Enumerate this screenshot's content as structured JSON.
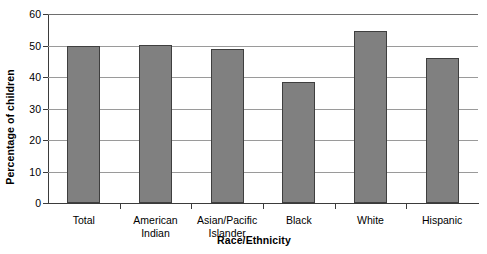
{
  "chart_data": {
    "type": "bar",
    "title": "",
    "xlabel": "Race/Ethnicity",
    "ylabel": "Percentage of children",
    "categories": [
      "Total",
      "American Indian",
      "Asian/Pacific Islander",
      "Black",
      "White",
      "Hispanic"
    ],
    "category_lines": [
      [
        "Total"
      ],
      [
        "American",
        "Indian"
      ],
      [
        "Asian/Pacific",
        "Islander"
      ],
      [
        "Black"
      ],
      [
        "White"
      ],
      [
        "Hispanic"
      ]
    ],
    "values": [
      50.0,
      50.3,
      48.8,
      38.5,
      54.5,
      46.0
    ],
    "ylim": [
      0,
      60
    ],
    "yticks": [
      0,
      10,
      20,
      30,
      40,
      50,
      60
    ],
    "ytick_labels": [
      "0",
      "10",
      "20",
      "30",
      "40",
      "50",
      "60"
    ],
    "grid": true,
    "grid_axis": "y",
    "legend": false,
    "legend_position": "none",
    "bar_color": "#808080",
    "bar_edge_color": "#3f3f3f",
    "gridline_color": "#9a9a9a",
    "axis_color": "#3b3b3b",
    "text_color": "#000000"
  }
}
